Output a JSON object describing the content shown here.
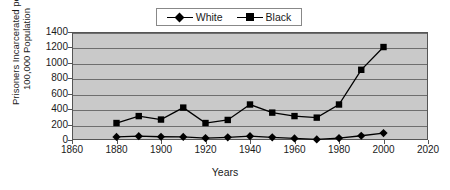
{
  "chart_data": {
    "type": "line",
    "title": "",
    "xlabel": "Years",
    "ylabel": "Prisoners Incarcerated per 100,000 Population",
    "xlim": [
      1860,
      2020
    ],
    "ylim": [
      0,
      1400
    ],
    "xticks": [
      1860,
      1880,
      1900,
      1920,
      1940,
      1960,
      1980,
      2000,
      2020
    ],
    "yticks": [
      0,
      200,
      400,
      600,
      800,
      1000,
      1200,
      1400
    ],
    "grid": true,
    "legend_position": "top-center",
    "x": [
      1880,
      1890,
      1900,
      1910,
      1920,
      1930,
      1940,
      1950,
      1960,
      1970,
      1980,
      1990,
      2000
    ],
    "series": [
      {
        "name": "White",
        "marker": "diamond",
        "color": "#000000",
        "values": [
          40,
          50,
          42,
          40,
          25,
          35,
          50,
          35,
          20,
          8,
          25,
          55,
          90
        ]
      },
      {
        "name": "Black",
        "marker": "square",
        "color": "#000000",
        "values": [
          220,
          310,
          265,
          420,
          220,
          260,
          460,
          355,
          310,
          290,
          460,
          910,
          1205
        ]
      }
    ]
  },
  "legend": {
    "entries": [
      {
        "label": "White",
        "marker": "diamond"
      },
      {
        "label": "Black",
        "marker": "square"
      }
    ]
  },
  "axes": {
    "y_title": "Prisoners Incarcerated per 100,000 Population",
    "x_title": "Years",
    "y_tick_labels": [
      "1400",
      "1200",
      "1000",
      "800",
      "600",
      "400",
      "200",
      "0"
    ],
    "x_tick_labels": [
      "1860",
      "1880",
      "1900",
      "1920",
      "1940",
      "1960",
      "1980",
      "2000",
      "2020"
    ]
  },
  "colors": {
    "plot_background": "#c9c9c9",
    "gridline": "#6e6e6e",
    "frame": "#555555",
    "series": "#000000",
    "page_background": "#ffffff"
  }
}
